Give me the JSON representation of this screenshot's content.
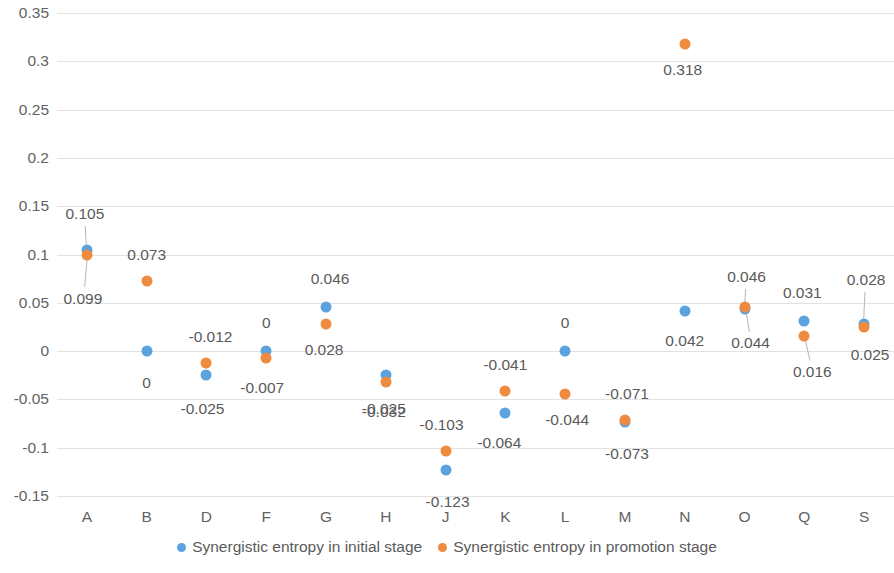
{
  "chart_data": {
    "type": "scatter",
    "title": "",
    "xlabel": "",
    "ylabel": "",
    "ylim": [
      -0.15,
      0.35
    ],
    "ytick_step": 0.05,
    "grid": true,
    "legend_position": "bottom",
    "categories": [
      "A",
      "B",
      "D",
      "F",
      "G",
      "H",
      "J",
      "K",
      "L",
      "M",
      "N",
      "O",
      "Q",
      "S"
    ],
    "ytick_labels": [
      "0.35",
      "0.3",
      "0.25",
      "0.2",
      "0.15",
      "0.1",
      "0.05",
      "0",
      "-0.05",
      "-0.1",
      "-0.15"
    ],
    "ytick_values": [
      0.35,
      0.3,
      0.25,
      0.2,
      0.15,
      0.1,
      0.05,
      0,
      -0.05,
      -0.1,
      -0.15
    ],
    "series": [
      {
        "name": "Synergistic entropy in initial stage",
        "color": "#5BA3DE",
        "values": [
          0.105,
          0,
          -0.025,
          0,
          0.046,
          -0.025,
          -0.123,
          -0.064,
          0,
          -0.073,
          0.042,
          0.044,
          0.031,
          0.028
        ],
        "labels": [
          "0.105",
          "0",
          "-0.025",
          "0",
          "0.046",
          "-0.025",
          "-0.123",
          "-0.064",
          "0",
          "-0.073",
          "0.042",
          "0.044",
          "0.031",
          "0.028"
        ]
      },
      {
        "name": "Synergistic entropy in promotion stage",
        "color": "#EE8B3F",
        "values": [
          0.099,
          0.073,
          -0.012,
          -0.007,
          0.028,
          -0.032,
          -0.103,
          -0.041,
          -0.044,
          -0.071,
          0.318,
          0.046,
          0.016,
          0.025
        ],
        "labels": [
          "0.099",
          "0.073",
          "-0.012",
          "-0.007",
          "0.028",
          "-0.032",
          "-0.103",
          "-0.041",
          "-0.044",
          "-0.071",
          "0.318",
          "0.046",
          "0.016",
          "0.025"
        ]
      }
    ]
  },
  "legend": {
    "items": [
      {
        "label": "Synergistic entropy in initial stage",
        "color": "#5BA3DE"
      },
      {
        "label": "Synergistic entropy in promotion stage",
        "color": "#EE8B3F"
      }
    ]
  },
  "label_layout": {
    "initial": [
      {
        "cat": 0,
        "dx": -2,
        "dy": -36,
        "leader": true
      },
      {
        "cat": 1,
        "dx": 0,
        "dy": 32,
        "leader": false
      },
      {
        "cat": 2,
        "dx": -4,
        "dy": 34,
        "leader": false
      },
      {
        "cat": 3,
        "dx": 0,
        "dy": -28,
        "leader": false
      },
      {
        "cat": 4,
        "dx": 4,
        "dy": -28,
        "leader": false
      },
      {
        "cat": 5,
        "dx": -2,
        "dy": 34,
        "leader": false
      },
      {
        "cat": 6,
        "dx": 2,
        "dy": 32,
        "leader": false
      },
      {
        "cat": 7,
        "dx": -6,
        "dy": 30,
        "leader": false
      },
      {
        "cat": 8,
        "dx": 0,
        "dy": -28,
        "leader": false
      },
      {
        "cat": 9,
        "dx": 2,
        "dy": 32,
        "leader": false
      },
      {
        "cat": 10,
        "dx": 0,
        "dy": 30,
        "leader": false
      },
      {
        "cat": 11,
        "dx": 6,
        "dy": 34,
        "leader": true
      },
      {
        "cat": 12,
        "dx": -2,
        "dy": -28,
        "leader": false
      },
      {
        "cat": 13,
        "dx": 2,
        "dy": -44,
        "leader": true
      }
    ],
    "promotion": [
      {
        "cat": 0,
        "dx": -4,
        "dy": 44,
        "leader": true
      },
      {
        "cat": 1,
        "dx": 0,
        "dy": -26,
        "leader": false
      },
      {
        "cat": 2,
        "dx": 4,
        "dy": -26,
        "leader": false
      },
      {
        "cat": 3,
        "dx": -4,
        "dy": 30,
        "leader": false
      },
      {
        "cat": 4,
        "dx": -2,
        "dy": 26,
        "leader": false
      },
      {
        "cat": 5,
        "dx": -2,
        "dy": 30,
        "leader": false
      },
      {
        "cat": 6,
        "dx": -4,
        "dy": -26,
        "leader": false
      },
      {
        "cat": 7,
        "dx": 0,
        "dy": -26,
        "leader": false
      },
      {
        "cat": 8,
        "dx": 2,
        "dy": 26,
        "leader": false
      },
      {
        "cat": 9,
        "dx": 2,
        "dy": -26,
        "leader": false
      },
      {
        "cat": 10,
        "dx": -2,
        "dy": 26,
        "leader": false
      },
      {
        "cat": 11,
        "dx": 2,
        "dy": -30,
        "leader": true
      },
      {
        "cat": 12,
        "dx": 8,
        "dy": 36,
        "leader": true
      },
      {
        "cat": 13,
        "dx": 6,
        "dy": 28,
        "leader": false
      }
    ]
  }
}
